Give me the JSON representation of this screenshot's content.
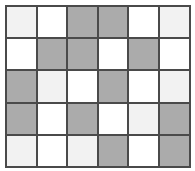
{
  "figure": {
    "title": ""
  },
  "chart_data": {
    "type": "heatmap",
    "title": "",
    "subtitle": "",
    "xlabel": "",
    "ylabel": "",
    "grid": true,
    "legend": "none",
    "rows": 5,
    "columns": 6,
    "palette": {
      "white": "#ffffff",
      "light": "#f2f2f2",
      "gray": "#ababab",
      "gridline": "#4a4a4a",
      "background": "#ffffff"
    },
    "shade_levels": [
      "white",
      "light",
      "gray"
    ],
    "cells": [
      [
        "light",
        "white",
        "gray",
        "gray",
        "white",
        "light"
      ],
      [
        "white",
        "gray",
        "gray",
        "white",
        "gray",
        "white"
      ],
      [
        "gray",
        "light",
        "white",
        "gray",
        "white",
        "light"
      ],
      [
        "gray",
        "white",
        "gray",
        "white",
        "light",
        "gray"
      ],
      [
        "light",
        "white",
        "light",
        "gray",
        "white",
        "gray"
      ]
    ],
    "values": [
      [
        1,
        0,
        2,
        2,
        0,
        1
      ],
      [
        0,
        2,
        2,
        0,
        2,
        0
      ],
      [
        2,
        1,
        0,
        2,
        0,
        1
      ],
      [
        2,
        0,
        2,
        0,
        1,
        2
      ],
      [
        1,
        0,
        1,
        2,
        0,
        2
      ]
    ],
    "xticklabels": [
      "",
      "",
      "",
      "",
      "",
      ""
    ],
    "yticklabels": [
      "",
      "",
      "",
      "",
      ""
    ]
  }
}
